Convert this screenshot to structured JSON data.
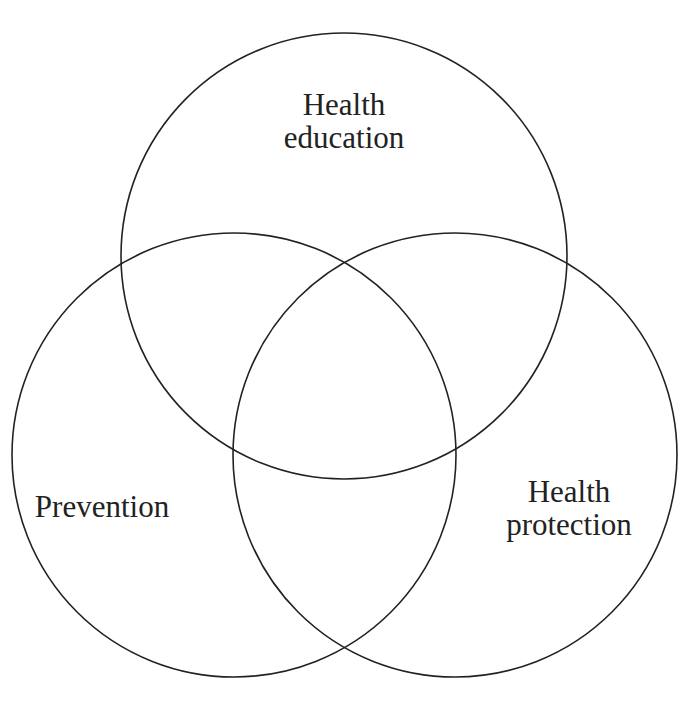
{
  "diagram": {
    "type": "venn",
    "stroke_color": "#222222",
    "background": "#ffffff",
    "sets": [
      {
        "id": "health-education",
        "lines": [
          "Health",
          "education"
        ],
        "center": [
          344,
          256
        ],
        "radius": 223
      },
      {
        "id": "prevention",
        "lines": [
          "Prevention"
        ],
        "center": [
          234,
          455
        ],
        "radius": 222
      },
      {
        "id": "health-protection",
        "lines": [
          "Health",
          "protection"
        ],
        "center": [
          455,
          455
        ],
        "radius": 222
      }
    ]
  }
}
